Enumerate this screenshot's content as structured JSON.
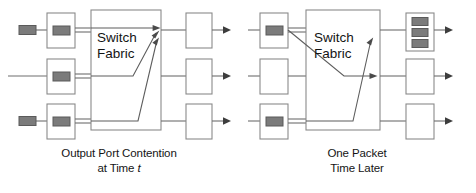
{
  "figure": {
    "colors": {
      "line": "#6e6e6e",
      "arrow": "#555555",
      "packet_fill": "#7b7b7b",
      "packet_stroke": "#5a5a5a",
      "box_stroke": "#8a8a8a",
      "fabric_stroke": "#8a8a8a",
      "background": "#ffffff",
      "text": "#141414"
    },
    "stroke_width": 1.1
  },
  "panels": [
    {
      "id": "left",
      "fabric_label_line1": "Switch",
      "fabric_label_line2": "Fabric",
      "caption_line1": "Output Port Contention",
      "caption_line2_prefix": "at Time ",
      "caption_line2_italic": "t",
      "input_ports": [
        {
          "index": 0,
          "label": "input-port-1",
          "has_packet": true,
          "incoming_packet": true
        },
        {
          "index": 1,
          "label": "input-port-2",
          "has_packet": true,
          "incoming_packet": false
        },
        {
          "index": 2,
          "label": "input-port-3",
          "has_packet": true,
          "incoming_packet": true
        }
      ],
      "output_ports": [
        {
          "index": 0,
          "label": "output-port-1",
          "queued_packets": 0
        },
        {
          "index": 1,
          "label": "output-port-2",
          "queued_packets": 0
        },
        {
          "index": 2,
          "label": "output-port-3",
          "queued_packets": 0
        }
      ],
      "routes": [
        {
          "from_input": 0,
          "to_output": 0,
          "note": "straight to top output"
        },
        {
          "from_input": 1,
          "to_output": 0,
          "note": "bends up to top output"
        },
        {
          "from_input": 2,
          "to_output": 0,
          "note": "bends up to top output"
        }
      ]
    },
    {
      "id": "right",
      "fabric_label_line1": "Switch",
      "fabric_label_line2": "Fabric",
      "caption_line1": "One Packet",
      "caption_line2": "Time Later",
      "input_ports": [
        {
          "index": 0,
          "label": "input-port-1",
          "has_packet": true,
          "incoming_packet": false
        },
        {
          "index": 1,
          "label": "input-port-2",
          "has_packet": false,
          "incoming_packet": false
        },
        {
          "index": 2,
          "label": "input-port-3",
          "has_packet": true,
          "incoming_packet": false
        }
      ],
      "output_ports": [
        {
          "index": 0,
          "label": "output-port-1",
          "queued_packets": 3
        },
        {
          "index": 1,
          "label": "output-port-2",
          "queued_packets": 0
        },
        {
          "index": 2,
          "label": "output-port-3",
          "queued_packets": 0
        }
      ],
      "routes": [
        {
          "from_input": 0,
          "to_output": 1,
          "note": "bends down to middle output"
        },
        {
          "from_input": 2,
          "to_output": 0,
          "note": "bends up to top output"
        }
      ]
    }
  ]
}
